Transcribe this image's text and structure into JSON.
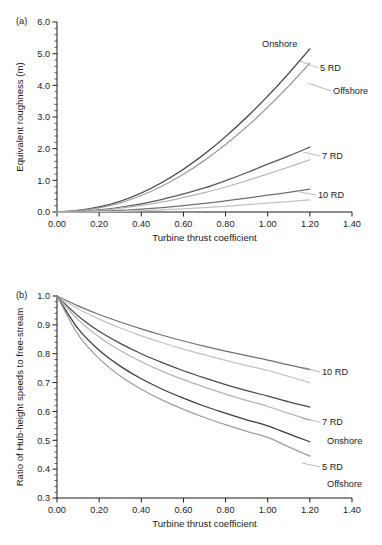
{
  "figure": {
    "panels": [
      "a",
      "b"
    ]
  },
  "panel_a": {
    "tag": "(a)",
    "labels": [
      {
        "name": "onshore-5rd",
        "text": "Onshore"
      },
      {
        "name": "5rd",
        "text": "5 RD"
      },
      {
        "name": "offshore-5rd",
        "text": "Offshore"
      },
      {
        "name": "7rd",
        "text": "7 RD"
      },
      {
        "name": "10rd",
        "text": "10 RD"
      }
    ]
  },
  "panel_b": {
    "tag": "(b)",
    "labels": [
      {
        "name": "10rd",
        "text": "10 RD"
      },
      {
        "name": "7rd",
        "text": "7 RD"
      },
      {
        "name": "onshore-5rd",
        "text": "Onshore"
      },
      {
        "name": "5rd",
        "text": "5 RD"
      },
      {
        "name": "offshore-5rd",
        "text": "Offshore"
      }
    ]
  },
  "chart_data": [
    {
      "panel": "a",
      "type": "line",
      "title": "",
      "xlabel": "Turbine thrust coefficient",
      "ylabel": "Equivalent roughness (m)",
      "xlim": [
        0.0,
        1.4
      ],
      "ylim": [
        0.0,
        6.0
      ],
      "xticks": [
        "0.00",
        "0.20",
        "0.40",
        "0.60",
        "0.80",
        "1.00",
        "1.20",
        "1.40"
      ],
      "xtick_values": [
        0.0,
        0.2,
        0.4,
        0.6,
        0.8,
        1.0,
        1.2,
        1.4
      ],
      "yticks": [
        "0.0",
        "1.0",
        "2.0",
        "3.0",
        "4.0",
        "5.0",
        "6.0"
      ],
      "ytick_values": [
        0.0,
        1.0,
        2.0,
        3.0,
        4.0,
        5.0,
        6.0
      ],
      "grid": false,
      "legend": "inline-annotations",
      "x": [
        0.0,
        0.1,
        0.2,
        0.3,
        0.4,
        0.5,
        0.6,
        0.7,
        0.8,
        0.9,
        1.0,
        1.1,
        1.2
      ],
      "series": [
        {
          "name": "5 RD Onshore",
          "color": "#3c3c3c",
          "values": [
            0.0,
            0.05,
            0.16,
            0.34,
            0.6,
            0.94,
            1.35,
            1.83,
            2.38,
            2.99,
            3.66,
            4.38,
            5.15
          ]
        },
        {
          "name": "5 RD Offshore",
          "color": "#9e9e9e",
          "values": [
            0.0,
            0.04,
            0.13,
            0.29,
            0.52,
            0.82,
            1.19,
            1.63,
            2.13,
            2.69,
            3.31,
            3.98,
            4.7
          ]
        },
        {
          "name": "7 RD Onshore",
          "color": "#5a5a5a",
          "values": [
            0.0,
            0.02,
            0.07,
            0.15,
            0.26,
            0.4,
            0.57,
            0.76,
            0.99,
            1.24,
            1.51,
            1.77,
            2.05
          ]
        },
        {
          "name": "7 RD Offshore",
          "color": "#b4b4b4",
          "values": [
            0.0,
            0.02,
            0.05,
            0.12,
            0.21,
            0.32,
            0.46,
            0.61,
            0.79,
            0.99,
            1.2,
            1.42,
            1.65
          ]
        },
        {
          "name": "10 RD Onshore",
          "color": "#707070",
          "values": [
            0.0,
            0.01,
            0.02,
            0.05,
            0.09,
            0.14,
            0.2,
            0.27,
            0.35,
            0.44,
            0.53,
            0.62,
            0.72
          ]
        },
        {
          "name": "10 RD Offshore",
          "color": "#c2c2c2",
          "values": [
            0.0,
            0.0,
            0.01,
            0.02,
            0.04,
            0.07,
            0.1,
            0.14,
            0.18,
            0.23,
            0.28,
            0.33,
            0.38
          ]
        }
      ]
    },
    {
      "panel": "b",
      "type": "line",
      "title": "",
      "xlabel": "Turbine thrust coefficient",
      "ylabel": "Ratio of Hub-height speeds to free-stream",
      "xlim": [
        0.0,
        1.4
      ],
      "ylim": [
        0.3,
        1.0
      ],
      "xticks": [
        "0.00",
        "0.20",
        "0.40",
        "0.60",
        "0.80",
        "1.00",
        "1.20",
        "1.40"
      ],
      "xtick_values": [
        0.0,
        0.2,
        0.4,
        0.6,
        0.8,
        1.0,
        1.2,
        1.4
      ],
      "yticks": [
        "0.3",
        "0.4",
        "0.5",
        "0.6",
        "0.7",
        "0.8",
        "0.9",
        "1.0"
      ],
      "ytick_values": [
        0.3,
        0.4,
        0.5,
        0.6,
        0.7,
        0.8,
        0.9,
        1.0
      ],
      "grid": false,
      "legend": "inline-annotations",
      "x": [
        0.0,
        0.1,
        0.2,
        0.3,
        0.4,
        0.5,
        0.6,
        0.7,
        0.8,
        0.9,
        1.0,
        1.1,
        1.2
      ],
      "series": [
        {
          "name": "10 RD Onshore",
          "color": "#707070",
          "values": [
            1.0,
            0.966,
            0.936,
            0.91,
            0.886,
            0.864,
            0.844,
            0.826,
            0.809,
            0.793,
            0.778,
            0.761,
            0.745
          ]
        },
        {
          "name": "10 RD Offshore",
          "color": "#c2c2c2",
          "values": [
            1.0,
            0.956,
            0.92,
            0.889,
            0.862,
            0.838,
            0.816,
            0.796,
            0.777,
            0.759,
            0.742,
            0.721,
            0.7
          ]
        },
        {
          "name": "7 RD Onshore",
          "color": "#4a4a4a",
          "values": [
            1.0,
            0.931,
            0.878,
            0.836,
            0.8,
            0.769,
            0.741,
            0.716,
            0.693,
            0.672,
            0.653,
            0.633,
            0.615
          ]
        },
        {
          "name": "7 RD Offshore",
          "color": "#b4b4b4",
          "values": [
            1.0,
            0.918,
            0.858,
            0.811,
            0.772,
            0.739,
            0.71,
            0.684,
            0.66,
            0.638,
            0.617,
            0.593,
            0.57
          ]
        },
        {
          "name": "5 RD Onshore",
          "color": "#3c3c3c",
          "values": [
            1.0,
            0.887,
            0.812,
            0.757,
            0.713,
            0.677,
            0.646,
            0.618,
            0.594,
            0.571,
            0.55,
            0.522,
            0.495
          ]
        },
        {
          "name": "5 RD Offshore",
          "color": "#9e9e9e",
          "values": [
            1.0,
            0.866,
            0.783,
            0.723,
            0.677,
            0.639,
            0.607,
            0.579,
            0.554,
            0.531,
            0.51,
            0.477,
            0.445
          ]
        }
      ]
    }
  ]
}
